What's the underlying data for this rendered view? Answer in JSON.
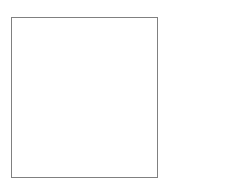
{
  "canvas": {
    "width": 246,
    "height": 185,
    "background_color": "#ffffff"
  },
  "panel": {
    "name": "empty-panel",
    "content_text": "",
    "border_color": "#808080",
    "border_width_px": 1,
    "fill_color": "#ffffff",
    "x": 11,
    "y": 17,
    "width": 147,
    "height": 161
  }
}
